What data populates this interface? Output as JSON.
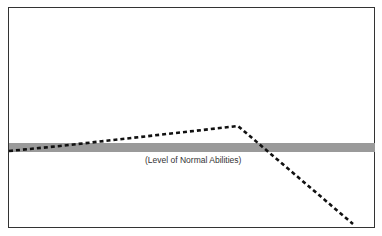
{
  "diagram": {
    "type": "line",
    "band": {
      "label": "(Level of Normal Abilities)",
      "color": "#9a9a9a",
      "y_top": 143,
      "y_bottom": 152
    },
    "line": {
      "style": "dashed",
      "color": "#111111",
      "points": [
        [
          9,
          151
        ],
        [
          60,
          146
        ],
        [
          238,
          126
        ],
        [
          353,
          224
        ]
      ]
    },
    "frame_color": "#333333"
  }
}
